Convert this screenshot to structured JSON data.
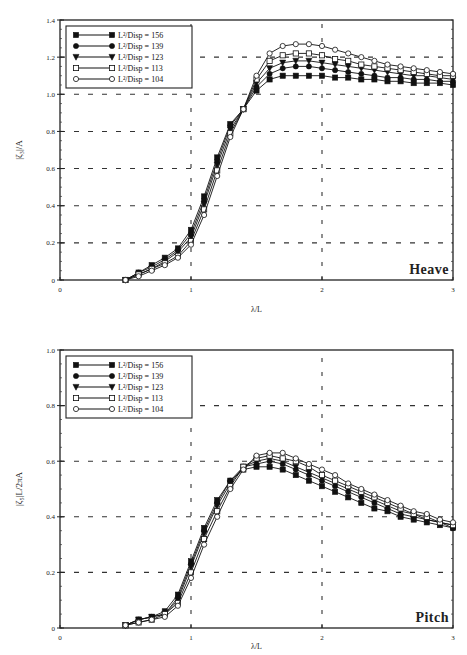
{
  "chart_data": [
    {
      "type": "line",
      "title": "Heave",
      "xlabel": "λ/L",
      "ylabel": "|ζ₃|/A",
      "xlim": [
        0,
        3
      ],
      "ylim": [
        0,
        1.4
      ],
      "xticks": [
        "0",
        "1",
        "2",
        "3"
      ],
      "yticks": [
        "0",
        "0.2",
        "0.4",
        "0.6",
        "0.8",
        "1.0",
        "1.2",
        "1.4"
      ],
      "grid": "dashed",
      "legend_position": "upper-left",
      "x": [
        0.5,
        0.6,
        0.7,
        0.8,
        0.9,
        1.0,
        1.1,
        1.2,
        1.3,
        1.4,
        1.5,
        1.6,
        1.7,
        1.8,
        1.9,
        2.0,
        2.1,
        2.2,
        2.3,
        2.4,
        2.5,
        2.6,
        2.7,
        2.8,
        2.9,
        3.0
      ],
      "series": [
        {
          "name": "L²/Disp = 156",
          "marker": "filled-square",
          "values": [
            0.0,
            0.04,
            0.08,
            0.12,
            0.17,
            0.27,
            0.45,
            0.66,
            0.84,
            0.92,
            1.02,
            1.08,
            1.1,
            1.1,
            1.1,
            1.1,
            1.09,
            1.09,
            1.08,
            1.08,
            1.07,
            1.07,
            1.06,
            1.06,
            1.06,
            1.05
          ]
        },
        {
          "name": "L²/Disp = 139",
          "marker": "filled-circle",
          "values": [
            0.0,
            0.04,
            0.07,
            0.11,
            0.16,
            0.25,
            0.43,
            0.64,
            0.83,
            0.92,
            1.04,
            1.11,
            1.14,
            1.15,
            1.15,
            1.14,
            1.13,
            1.12,
            1.11,
            1.1,
            1.09,
            1.09,
            1.08,
            1.08,
            1.07,
            1.07
          ]
        },
        {
          "name": "L²/Disp = 123",
          "marker": "filled-triangle-down",
          "values": [
            0.0,
            0.03,
            0.06,
            0.1,
            0.15,
            0.23,
            0.41,
            0.62,
            0.81,
            0.92,
            1.06,
            1.14,
            1.17,
            1.18,
            1.18,
            1.17,
            1.16,
            1.15,
            1.14,
            1.13,
            1.12,
            1.11,
            1.1,
            1.1,
            1.09,
            1.08
          ]
        },
        {
          "name": "L²/Disp = 113",
          "marker": "open-square",
          "values": [
            0.0,
            0.03,
            0.06,
            0.09,
            0.13,
            0.21,
            0.38,
            0.59,
            0.79,
            0.92,
            1.08,
            1.18,
            1.21,
            1.22,
            1.22,
            1.21,
            1.19,
            1.18,
            1.16,
            1.15,
            1.14,
            1.13,
            1.12,
            1.11,
            1.1,
            1.1
          ]
        },
        {
          "name": "L²/Disp = 104",
          "marker": "open-circle",
          "values": [
            0.0,
            0.02,
            0.05,
            0.08,
            0.12,
            0.19,
            0.35,
            0.56,
            0.77,
            0.92,
            1.1,
            1.22,
            1.26,
            1.27,
            1.27,
            1.26,
            1.24,
            1.22,
            1.2,
            1.18,
            1.16,
            1.15,
            1.14,
            1.13,
            1.12,
            1.11
          ]
        }
      ]
    },
    {
      "type": "line",
      "title": "Pitch",
      "xlabel": "λ/L",
      "ylabel": "|ζ₅|L/2πA",
      "xlim": [
        0,
        3
      ],
      "ylim": [
        0,
        1.0
      ],
      "xticks": [
        "0",
        "1",
        "2",
        "3"
      ],
      "yticks": [
        "0",
        "0.2",
        "0.4",
        "0.6",
        "0.8",
        "1.0"
      ],
      "grid": "dashed",
      "legend_position": "upper-left",
      "x": [
        0.5,
        0.6,
        0.7,
        0.8,
        0.9,
        1.0,
        1.1,
        1.2,
        1.3,
        1.4,
        1.5,
        1.6,
        1.7,
        1.8,
        1.9,
        2.0,
        2.1,
        2.2,
        2.3,
        2.4,
        2.5,
        2.6,
        2.7,
        2.8,
        2.9,
        3.0
      ],
      "series": [
        {
          "name": "L²/Disp = 156",
          "marker": "filled-square",
          "values": [
            0.01,
            0.03,
            0.04,
            0.06,
            0.12,
            0.24,
            0.36,
            0.46,
            0.53,
            0.57,
            0.58,
            0.58,
            0.57,
            0.55,
            0.53,
            0.51,
            0.49,
            0.47,
            0.45,
            0.43,
            0.42,
            0.4,
            0.39,
            0.38,
            0.37,
            0.36
          ]
        },
        {
          "name": "L²/Disp = 139",
          "marker": "filled-circle",
          "values": [
            0.01,
            0.03,
            0.04,
            0.05,
            0.11,
            0.23,
            0.35,
            0.45,
            0.53,
            0.58,
            0.59,
            0.6,
            0.59,
            0.57,
            0.55,
            0.53,
            0.51,
            0.49,
            0.47,
            0.45,
            0.43,
            0.41,
            0.4,
            0.39,
            0.38,
            0.36
          ]
        },
        {
          "name": "L²/Disp = 123",
          "marker": "filled-triangle-down",
          "values": [
            0.01,
            0.03,
            0.04,
            0.05,
            0.1,
            0.22,
            0.34,
            0.44,
            0.52,
            0.58,
            0.6,
            0.61,
            0.6,
            0.58,
            0.56,
            0.54,
            0.52,
            0.5,
            0.48,
            0.46,
            0.44,
            0.42,
            0.41,
            0.39,
            0.38,
            0.37
          ]
        },
        {
          "name": "L²/Disp = 113",
          "marker": "open-square",
          "values": [
            0.01,
            0.02,
            0.03,
            0.05,
            0.09,
            0.2,
            0.32,
            0.42,
            0.51,
            0.58,
            0.61,
            0.62,
            0.61,
            0.6,
            0.58,
            0.55,
            0.53,
            0.51,
            0.49,
            0.47,
            0.45,
            0.43,
            0.41,
            0.4,
            0.38,
            0.37
          ]
        },
        {
          "name": "L²/Disp = 104",
          "marker": "open-circle",
          "values": [
            0.01,
            0.02,
            0.03,
            0.04,
            0.08,
            0.18,
            0.3,
            0.4,
            0.5,
            0.57,
            0.62,
            0.63,
            0.63,
            0.61,
            0.59,
            0.57,
            0.55,
            0.52,
            0.5,
            0.48,
            0.46,
            0.44,
            0.42,
            0.41,
            0.39,
            0.38
          ]
        }
      ]
    }
  ],
  "labels": {
    "heave_panel": "Heave",
    "pitch_panel": "Pitch",
    "heave_ylabel": "|ζ₃|/A",
    "pitch_ylabel": "|ζ₅|L/2πA",
    "xlabel": "λ/L"
  }
}
